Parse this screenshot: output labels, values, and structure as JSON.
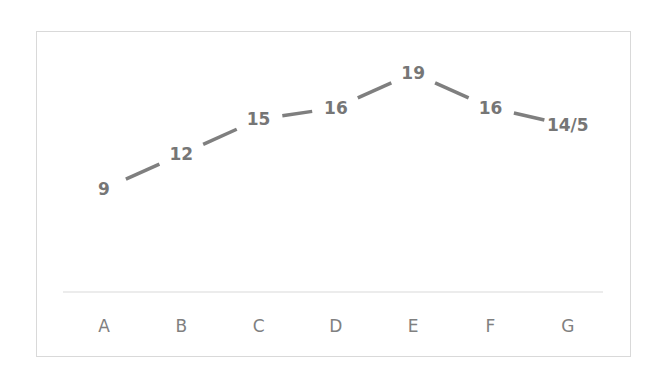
{
  "chart_data": {
    "type": "line",
    "title": "",
    "xlabel": "",
    "ylabel": "",
    "categories": [
      "A",
      "B",
      "C",
      "D",
      "E",
      "F",
      "G"
    ],
    "values": [
      9,
      12,
      15,
      16,
      19,
      16,
      14.5
    ],
    "data_labels": [
      "9",
      "12",
      "15",
      "16",
      "19",
      "16",
      "14/5"
    ],
    "ylim": [
      0,
      20
    ],
    "grid": false,
    "legend": "none",
    "line_color": "#7f7f7f",
    "axis_color": "#d9d9d9"
  }
}
